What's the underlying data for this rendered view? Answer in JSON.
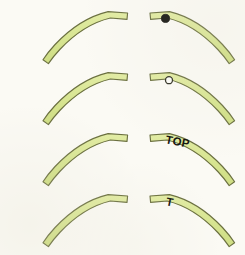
{
  "figure": {
    "background_color": "#fbfaf4",
    "width": 245,
    "height": 255,
    "columns": 2,
    "rows": 4
  },
  "style": {
    "band_fill": "#d9e694",
    "band_fill_light": "#e4eeab",
    "band_fill_dark": "#cadd80",
    "band_stroke": "#6b7040",
    "marker_filled_color": "#141410",
    "marker_hollow_fill": "#fdfdf8",
    "marker_hollow_stroke": "#2e2e22",
    "label_color": "#141410"
  },
  "arcs": [
    {
      "id": "arc-r1-left",
      "row": 1,
      "column": "left",
      "orientation": "rising-right",
      "marker": "none",
      "label": ""
    },
    {
      "id": "arc-r1-right",
      "row": 1,
      "column": "right",
      "orientation": "falling-right",
      "marker": "filled-circle",
      "label": ""
    },
    {
      "id": "arc-r2-left",
      "row": 2,
      "column": "left",
      "orientation": "rising-right",
      "marker": "none",
      "label": ""
    },
    {
      "id": "arc-r2-right",
      "row": 2,
      "column": "right",
      "orientation": "falling-right",
      "marker": "hollow-circle",
      "label": ""
    },
    {
      "id": "arc-r3-left",
      "row": 3,
      "column": "left",
      "orientation": "rising-right",
      "marker": "none",
      "label": ""
    },
    {
      "id": "arc-r3-right",
      "row": 3,
      "column": "right",
      "orientation": "falling-right",
      "marker": "text",
      "label": "TOP"
    },
    {
      "id": "arc-r4-left",
      "row": 4,
      "column": "left",
      "orientation": "rising-right",
      "marker": "none",
      "label": ""
    },
    {
      "id": "arc-r4-right",
      "row": 4,
      "column": "right",
      "orientation": "falling-right",
      "marker": "text",
      "label": "T"
    }
  ],
  "labels": {
    "top": "TOP",
    "t": "T"
  }
}
